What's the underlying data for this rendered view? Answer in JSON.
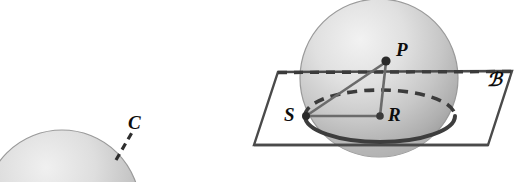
{
  "figure": {
    "labels": {
      "point_p": "P",
      "point_s": "S",
      "point_r": "R",
      "point_c": "C",
      "plane_b": "ℬ"
    },
    "colors": {
      "sphere_fill_light": "#e8e8e8",
      "sphere_fill_mid": "#c9c9c9",
      "sphere_fill_dark": "#a9a9a9",
      "sphere_edge": "#9a9a9a",
      "line_dark": "#3b3b3b",
      "line_mid": "#5d5d5d",
      "plane_stroke": "#4a4a4a",
      "background": "#ffffff",
      "label_color": "#0d0d0d"
    },
    "geometry": {
      "right_sphere": {
        "cx": 379,
        "cy": 78,
        "r": 79
      },
      "left_sphere": {
        "cx": 62,
        "cy": 208,
        "r": 78
      },
      "plane_corners": [
        {
          "x": 278,
          "y": 72
        },
        {
          "x": 512,
          "y": 71
        },
        {
          "x": 488,
          "y": 145
        },
        {
          "x": 254,
          "y": 145
        }
      ],
      "small_circle": {
        "cx": 380,
        "cy": 116,
        "rx": 75,
        "ry": 26
      },
      "great_circle_dashed_y": 73,
      "point_p": {
        "x": 386,
        "y": 61
      },
      "point_s": {
        "x": 306,
        "y": 116
      },
      "point_r": {
        "x": 380,
        "y": 116
      },
      "segment_c_dashed": {
        "x1": 116,
        "y1": 159,
        "x2": 133,
        "y2": 130
      }
    }
  }
}
